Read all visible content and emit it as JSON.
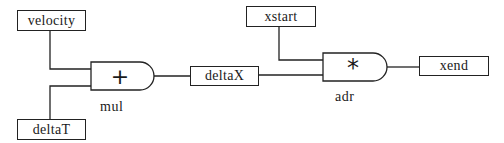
{
  "diagram": {
    "nodes": {
      "velocity": {
        "label": "velocity"
      },
      "deltaT": {
        "label": "deltaT"
      },
      "deltaX": {
        "label": "deltaX"
      },
      "xstart": {
        "label": "xstart"
      },
      "xend": {
        "label": "xend"
      }
    },
    "gates": {
      "mul": {
        "symbol": "+",
        "name": "mul"
      },
      "adr": {
        "symbol": "*",
        "name": "adr"
      }
    },
    "edges": [
      {
        "from": "velocity",
        "to": "mul"
      },
      {
        "from": "deltaT",
        "to": "mul"
      },
      {
        "from": "mul",
        "to": "deltaX"
      },
      {
        "from": "deltaX",
        "to": "adr"
      },
      {
        "from": "xstart",
        "to": "adr"
      },
      {
        "from": "adr",
        "to": "xend"
      }
    ]
  }
}
